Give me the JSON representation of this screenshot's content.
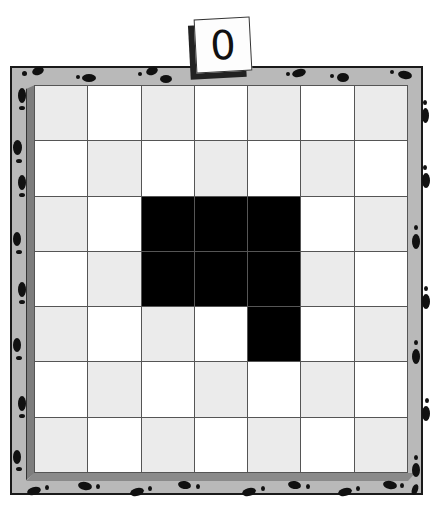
{
  "counter": {
    "value": "0",
    "label": "moves counter"
  },
  "board": {
    "rows": 7,
    "cols": 7,
    "colors": {
      "frame": "#b9b9b9",
      "light_cell": "#ebebeb",
      "white_cell": "#ffffff",
      "filled_cell": "#000000",
      "footprint": "#111111"
    },
    "filled_cells": [
      [
        2,
        2
      ],
      [
        2,
        3
      ],
      [
        2,
        4
      ],
      [
        3,
        2
      ],
      [
        3,
        3
      ],
      [
        3,
        4
      ],
      [
        4,
        4
      ]
    ]
  },
  "decoration": {
    "border_pattern": "footprints"
  }
}
